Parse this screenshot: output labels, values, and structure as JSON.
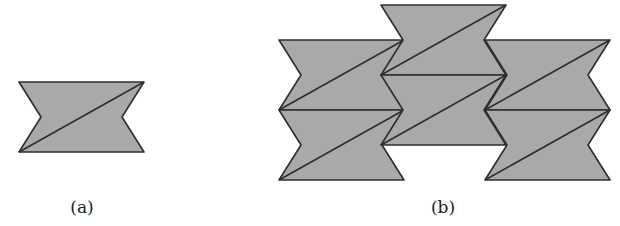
{
  "figure": {
    "fill_color": "#a9a9a9",
    "stroke_color": "#2e2e2e",
    "tile": {
      "description": "hexagonal bow-tie shape with V-notches on left and right sides, split by a diagonal from bottom-left to top-right",
      "width": 125,
      "height": 70,
      "notch_depth": 22
    },
    "panels": [
      {
        "id": "a",
        "label": "(a)",
        "label_pos": [
          82,
          207
        ],
        "tiles": [
          [
            19,
            82
          ]
        ]
      },
      {
        "id": "b",
        "label": "(b)",
        "label_pos": [
          443,
          207
        ],
        "tiles": [
          [
            279,
            40
          ],
          [
            279,
            110
          ],
          [
            381,
            5
          ],
          [
            381,
            75
          ],
          [
            485,
            40
          ],
          [
            485,
            110
          ]
        ]
      }
    ]
  }
}
